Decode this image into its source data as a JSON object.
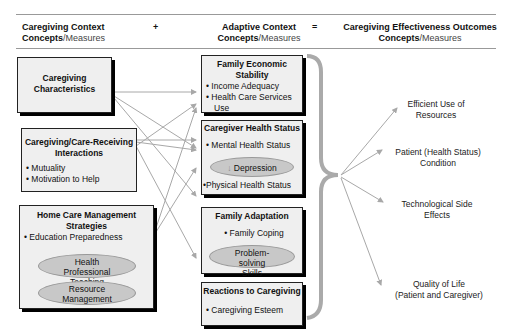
{
  "header": {
    "col1": {
      "bold": "Caregiving Context",
      "line2_bold": "Concepts",
      "line2_light": "/Measures"
    },
    "op1": "+",
    "col2": {
      "bold": "Adaptive Context",
      "line2_bold": "Concepts",
      "line2_light": "/Measures"
    },
    "op2": "=",
    "col3": {
      "bold": "Caregiving Effectiveness Outcomes",
      "line2_bold": "Concepts",
      "line2_light": "/Measures"
    }
  },
  "context_boxes": [
    {
      "title": "Caregiving Characteristics",
      "items": []
    },
    {
      "title": "Caregiving/Care-Receiving Interactions",
      "items": [
        "• Mutuality",
        "• Motivation to Help"
      ]
    },
    {
      "title": "Home Care Management Strategies",
      "items": [
        "• Education Preparedness"
      ],
      "ellipses": [
        "Health Professional Teaching",
        "Resource Management"
      ]
    }
  ],
  "adaptive_boxes": [
    {
      "title": "Family Economic Stability",
      "items": [
        "• Income Adequacy",
        "• Health Care Services",
        "Use"
      ]
    },
    {
      "title": "Caregiver Health Status",
      "items": [
        "• Mental Health Status",
        "•Physical Health Status"
      ],
      "ellipses": [
        "Depression"
      ],
      "ellipse_arrow": "↓"
    },
    {
      "title": "Family Adaptation",
      "items": [
        "• Family Coping"
      ],
      "ellipses": [
        "Problem-solving Skills"
      ]
    },
    {
      "title": "Reactions to Caregiving",
      "items": [
        "• Caregiving Esteem"
      ]
    }
  ],
  "outcomes": [
    {
      "line1": "Efficient Use of",
      "line2": "Resources"
    },
    {
      "line1": "Patient (Health Status)",
      "line2": "Condition"
    },
    {
      "line1": "Technological Side",
      "line2": "Effects"
    },
    {
      "line1": "Quality of Life",
      "line2": "(Patient and Caregiver)"
    }
  ],
  "colors": {
    "box_fill": "#efefef",
    "ellipse_fill": "#c8c8c8",
    "arrow": "#a8a8a8",
    "brace": "#aaaaaa"
  }
}
